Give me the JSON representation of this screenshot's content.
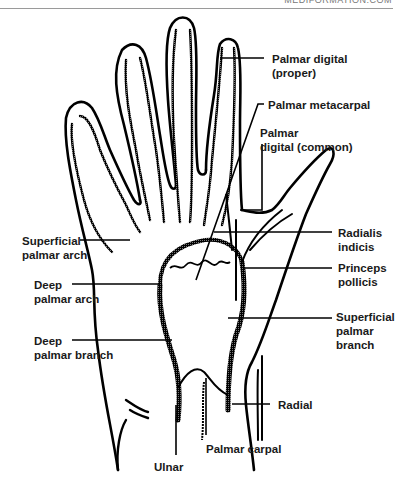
{
  "header": {
    "source_text": "MEDIFORMATION.COM"
  },
  "diagram": {
    "labels": {
      "palmar_digital_proper": "Palmar digital\n(proper)",
      "palmar_metacarpal": "Palmar metacarpal",
      "palmar_digital_common": "Palmar\ndigital (common)",
      "radialis_indicis": "Radialis\nindicis",
      "princeps_pollicis": "Princeps\npollicis",
      "superficial_palmar_branch": "Superficial\npalmar\nbranch",
      "radial": "Radial",
      "palmar_carpal": "Palmar carpal",
      "ulnar": "Ulnar",
      "superficial_palmar_arch": "Superficial\npalmar arch",
      "deep_palmar_arch": "Deep\npalmar arch",
      "deep_palmar_branch": "Deep\npalmar branch"
    },
    "colors": {
      "outline": "#000000",
      "vessel": "#1a1a1a",
      "background": "#ffffff",
      "text": "#1a1a1a"
    }
  }
}
